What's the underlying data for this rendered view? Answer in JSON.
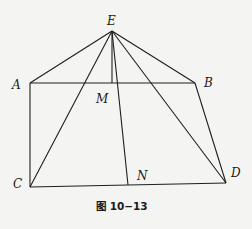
{
  "figure": {
    "caption": "图 10−13",
    "points": {
      "E": {
        "label": "E",
        "x": 112,
        "y": 31
      },
      "A": {
        "label": "A",
        "x": 30,
        "y": 83
      },
      "B": {
        "label": "B",
        "x": 195,
        "y": 83
      },
      "M": {
        "label": "M",
        "x": 112,
        "y": 83
      },
      "C": {
        "label": "C",
        "x": 30,
        "y": 187
      },
      "D": {
        "label": "D",
        "x": 226,
        "y": 183
      },
      "N": {
        "label": "N",
        "x": 128,
        "y": 185
      }
    },
    "segments": [
      "EA",
      "EB",
      "EC",
      "ED",
      "EM",
      "EN",
      "AB",
      "AC",
      "BD",
      "CD"
    ],
    "colors": {
      "line": "#1e1e1e",
      "background": "#f4f4f2"
    }
  }
}
